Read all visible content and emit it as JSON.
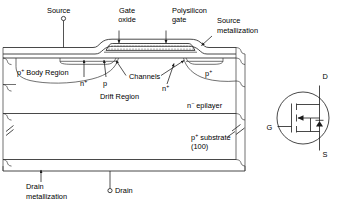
{
  "figure": {
    "background_color": "#ffffff",
    "line_color": "#1a1a1a"
  },
  "labels": {
    "source": "Source",
    "gate_oxide_line1": "Gate",
    "gate_oxide_line2": "oxide",
    "polysilicon_gate_line1": "Polysilicon",
    "polysilicon_gate_line2": "gate",
    "source_metallization_line1": "Source",
    "source_metallization_line2": "metallization",
    "p_plus_body_region": "p",
    "p_plus_body_region_sup": "+",
    "p_plus_body_region_rest": " Body Region",
    "channels": "Channels",
    "n_plus_left": "n",
    "n_plus_left_sup": "+",
    "p_center": "p",
    "n_plus_right": "n",
    "n_plus_right_sup": "+",
    "p_plus_right": "p",
    "p_plus_right_sup": "+",
    "drift_region": "Drift Region",
    "n_minus_epilayer": "n",
    "n_minus_epilayer_sup": "−",
    "n_minus_epilayer_rest": " epilayer",
    "p_plus_substrate": "p",
    "p_plus_substrate_sup": "+",
    "p_plus_substrate_rest": " substrate",
    "substrate_orientation": "(100)",
    "drain_metallization_line1": "Drain",
    "drain_metallization_line2": "metallization",
    "drain": "Drain"
  },
  "symbol": {
    "name": "mosfet-symbol",
    "terminal_drain": "D",
    "terminal_gate": "G",
    "terminal_source": "S"
  },
  "icons": {
    "source_terminal": "terminal-circle-icon",
    "drain_terminal": "terminal-circle-icon",
    "break_mark_left": "break-mark-icon",
    "break_mark_right": "break-mark-icon",
    "arrow_gate_oxide": "arrow-icon",
    "arrow_polysilicon": "arrow-icon",
    "arrow_source_metal": "arrow-icon",
    "arrow_drain_metal": "arrow-icon",
    "arrow_channel_left": "arrow-icon",
    "arrow_channel_right": "arrow-icon",
    "arrow_nplus_left": "arrow-icon",
    "arrow_p_center": "arrow-icon",
    "arrow_nplus_right": "arrow-icon",
    "body_diode_arrow": "diode-arrow-icon",
    "channel_arrow": "channel-arrow-icon"
  }
}
